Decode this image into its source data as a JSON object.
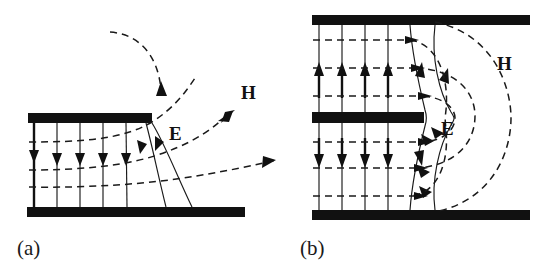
{
  "figure": {
    "background_color": "#ffffff",
    "ink_color": "#111111"
  },
  "panels": [
    {
      "id": "a",
      "caption": "(a)",
      "labels": {
        "e_label": "E",
        "h_label": "H"
      },
      "plates": [
        {
          "name": "top-plate",
          "x": 28,
          "y": 113,
          "w": 124,
          "h": 10
        },
        {
          "name": "bottom-plate",
          "x": 27,
          "y": 207,
          "w": 218,
          "h": 10
        }
      ],
      "e_lines_count": 7,
      "h_lines_count": 4,
      "e_arrow_direction": "down",
      "h_arrow_direction": "right-up"
    },
    {
      "id": "b",
      "caption": "(b)",
      "labels": {
        "e_label": "E",
        "h_label": "H"
      },
      "plates": [
        {
          "name": "top-plate",
          "x": 33,
          "y": 15,
          "w": 218,
          "h": 10
        },
        {
          "name": "center-plate",
          "x": 33,
          "y": 112,
          "w": 112,
          "h": 11
        },
        {
          "name": "bottom-plate",
          "x": 33,
          "y": 210,
          "w": 218,
          "h": 10
        }
      ],
      "e_lines_count": 7,
      "h_lines_count": 6,
      "e_arrow_direction_upper": "up",
      "e_arrow_direction_lower": "down",
      "h_arrow_direction": "right"
    }
  ]
}
